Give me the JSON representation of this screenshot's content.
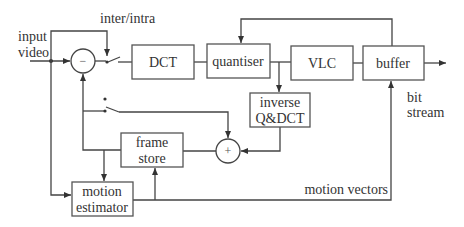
{
  "diagram": {
    "type": "block-diagram",
    "blocks": {
      "dct": {
        "label": "DCT"
      },
      "quantiser": {
        "label": "quantiser"
      },
      "vlc": {
        "label": "VLC"
      },
      "buffer": {
        "label": "buffer"
      },
      "inverse": {
        "line1": "inverse",
        "line2": "Q&DCT"
      },
      "frame_store": {
        "line1": "frame",
        "line2": "store"
      },
      "motion_estimator": {
        "line1": "motion",
        "line2": "estimator"
      }
    },
    "nodes": {
      "subtractor": {
        "symbol": "−"
      },
      "adder": {
        "symbol": "+"
      }
    },
    "labels": {
      "input_line1": "input",
      "input_line2": "video",
      "switch": "inter/intra",
      "output_line1": "bit",
      "output_line2": "stream",
      "motion_vectors": "motion vectors"
    },
    "colors": {
      "stroke": "#444444",
      "text": "#333333",
      "background": "#ffffff"
    }
  }
}
